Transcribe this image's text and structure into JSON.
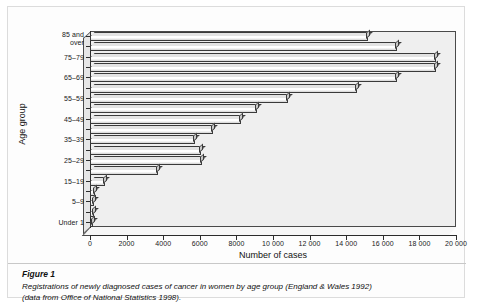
{
  "figure": {
    "caption_title": "Figure 1",
    "caption_line1": "Registrations of newly diagnosed cases of cancer in women by age group (England & Wales 1992)",
    "caption_line2": "(data from Office of National Statistics 1998)."
  },
  "chart_data": {
    "type": "bar",
    "orientation": "horizontal",
    "title": "",
    "xlabel": "Number of cases",
    "ylabel": "Age group",
    "xlim": [
      0,
      20000
    ],
    "ylim": null,
    "grid": false,
    "legend": null,
    "x_tick_labels": [
      "0",
      "2000",
      "4000",
      "6000",
      "8000",
      "10 000",
      "12 000",
      "14 000",
      "16 000",
      "18 000",
      "20 000"
    ],
    "x_tick_values": [
      0,
      2000,
      4000,
      6000,
      8000,
      10000,
      12000,
      14000,
      16000,
      18000,
      20000
    ],
    "categories": [
      "Under 1",
      "1–4",
      "5–9",
      "10–14",
      "15–19",
      "20–24",
      "25–29",
      "30–34",
      "35–39",
      "40–44",
      "45–49",
      "50–54",
      "55–59",
      "60–64",
      "65–69",
      "70–74",
      "75–79",
      "80–84",
      "85 and over"
    ],
    "visible_category_labels": [
      "Under 1",
      "5–9",
      "15–19",
      "25–29",
      "35–39",
      "45–49",
      "55–59",
      "65–69",
      "75–79",
      "85 and over"
    ],
    "values": [
      180,
      240,
      230,
      250,
      800,
      3700,
      6100,
      6050,
      5750,
      6700,
      8250,
      9100,
      10800,
      14600,
      16800,
      18900,
      18900,
      16800,
      15200
    ],
    "bars_top_to_bottom": [
      {
        "category": "85 and over",
        "value": 15200
      },
      {
        "category": "80–84",
        "value": 16800
      },
      {
        "category": "75–79",
        "value": 18900
      },
      {
        "category": "70–74",
        "value": 18900
      },
      {
        "category": "65–69",
        "value": 16800
      },
      {
        "category": "60–64",
        "value": 14600
      },
      {
        "category": "55–59",
        "value": 10800
      },
      {
        "category": "50–54",
        "value": 9100
      },
      {
        "category": "45–49",
        "value": 8250
      },
      {
        "category": "40–44",
        "value": 6700
      },
      {
        "category": "35–39",
        "value": 5750
      },
      {
        "category": "30–34",
        "value": 6050
      },
      {
        "category": "25–29",
        "value": 6100
      },
      {
        "category": "20–24",
        "value": 3700
      },
      {
        "category": "15–19",
        "value": 800
      },
      {
        "category": "10–14",
        "value": 250
      },
      {
        "category": "5–9",
        "value": 230
      },
      {
        "category": "1–4",
        "value": 240
      },
      {
        "category": "Under 1",
        "value": 180
      }
    ],
    "style": {
      "bar_face": "#ffffff",
      "bar_edge": "#3a3a3a",
      "plot_background": "#efefef",
      "axis_color": "#2c2c2c",
      "text_color": "#111111"
    }
  }
}
